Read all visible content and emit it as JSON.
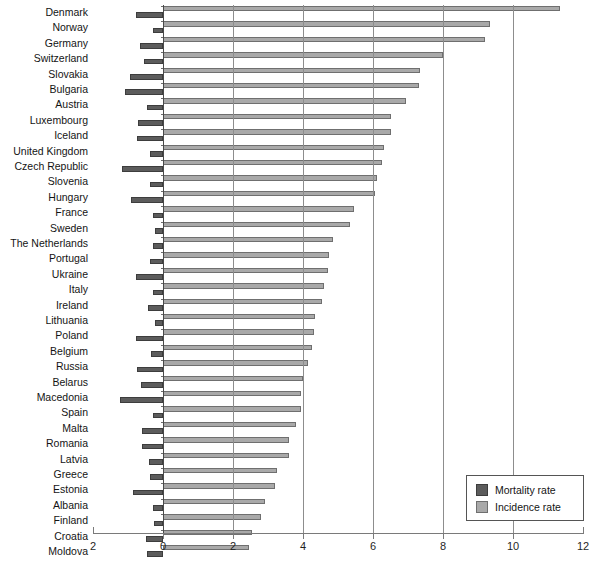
{
  "chart_data": {
    "type": "bar",
    "title": "",
    "subtitle": "",
    "xlabel": "",
    "ylabel": "",
    "orientation": "horizontal",
    "xlim": [
      -2,
      12
    ],
    "xticks": [
      -2,
      0,
      2,
      4,
      6,
      8,
      10,
      12
    ],
    "xtick_labels": [
      "2",
      "0",
      "2",
      "4",
      "6",
      "8",
      "10",
      "12"
    ],
    "grid": true,
    "grid_axis": "x",
    "legend_position": "bottom-right",
    "note": "Mortality rate is plotted to the left of zero (negative direction); incidence rate to the right.",
    "categories": [
      "Denmark",
      "Norway",
      "Germany",
      "Switzerland",
      "Slovakia",
      "Bulgaria",
      "Austria",
      "Luxembourg",
      "Iceland",
      "United Kingdom",
      "Czech Republic",
      "Slovenia",
      "Hungary",
      "France",
      "Sweden",
      "The Netherlands",
      "Portugal",
      "Ukraine",
      "Italy",
      "Ireland",
      "Lithuania",
      "Poland",
      "Belgium",
      "Russia",
      "Belarus",
      "Macedonia",
      "Spain",
      "Malta",
      "Romania",
      "Latvia",
      "Greece",
      "Estonia",
      "Albania",
      "Finland",
      "Croatia",
      "Moldova"
    ],
    "series": [
      {
        "name": "Mortality rate",
        "color": "#5c5c5c",
        "direction": "left",
        "values": [
          0.78,
          0.3,
          0.66,
          0.55,
          0.94,
          1.1,
          0.45,
          0.72,
          0.75,
          0.38,
          1.18,
          0.38,
          0.92,
          0.3,
          0.22,
          0.3,
          0.38,
          0.78,
          0.3,
          0.42,
          0.22,
          0.78,
          0.34,
          0.74,
          0.62,
          1.22,
          0.28,
          0.6,
          0.6,
          0.4,
          0.38,
          0.86,
          0.3,
          0.26,
          0.48,
          0.46
        ]
      },
      {
        "name": "Incidence rate",
        "color": "#a9a9a9",
        "direction": "right",
        "values": [
          11.35,
          9.35,
          9.2,
          8.0,
          7.35,
          7.3,
          6.95,
          6.5,
          6.5,
          6.3,
          6.25,
          6.1,
          6.05,
          5.45,
          5.35,
          4.85,
          4.75,
          4.7,
          4.6,
          4.55,
          4.35,
          4.3,
          4.25,
          4.15,
          4.0,
          3.95,
          3.95,
          3.8,
          3.6,
          3.6,
          3.25,
          3.2,
          2.9,
          2.8,
          2.55,
          2.45
        ]
      }
    ]
  },
  "legend": {
    "items": [
      {
        "label": "Mortality rate",
        "swatch": "dark-gray-swatch"
      },
      {
        "label": "Incidence rate",
        "swatch": "light-gray-swatch"
      }
    ]
  }
}
